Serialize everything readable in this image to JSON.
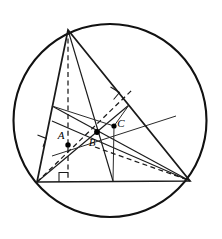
{
  "figure": {
    "background_color": "#ffffff",
    "stroke_color": "#1a1a1a",
    "width": 222,
    "height": 239
  },
  "circle": {
    "name": "circumcircle",
    "cx": 110,
    "cy": 120.5,
    "r": 96.5,
    "stroke": "#111111",
    "stroke_width": 2.1
  },
  "triangle": {
    "name": "main-triangle",
    "vertices": [
      {
        "label": "",
        "x": 68,
        "y": 30
      },
      {
        "label": "",
        "x": 37,
        "y": 182
      },
      {
        "label": "",
        "x": 190,
        "y": 181
      }
    ],
    "path": "M 68 30 L 37 182 L 190 181 Z"
  },
  "points": [
    {
      "id": "A",
      "label": "A",
      "x": 68,
      "y": 145,
      "label_x": 61,
      "label_y": 139,
      "role": "orthocenter"
    },
    {
      "id": "B",
      "label": "B",
      "x": 97,
      "y": 132,
      "label_x": 92,
      "label_y": 146,
      "role": "centroid"
    },
    {
      "id": "C",
      "label": "C",
      "x": 114,
      "y": 126,
      "label_x": 121,
      "label_y": 127,
      "role": "circumcenter"
    }
  ],
  "segments": {
    "altitudes": [
      {
        "name": "altitude-from-apex",
        "from": [
          68,
          30
        ],
        "to": [
          68,
          182
        ],
        "style": "dashed"
      },
      {
        "name": "altitude-from-bottom-left",
        "from": [
          37,
          182
        ],
        "to": [
          132,
          90
        ],
        "style": "dashed"
      },
      {
        "name": "altitude-from-bottom-right",
        "from": [
          190,
          181
        ],
        "to": [
          52,
          121
        ],
        "style": "solid"
      }
    ],
    "medians": [
      {
        "name": "median-from-apex",
        "from": [
          68,
          30
        ],
        "to": [
          113,
          181
        ],
        "style": "solid"
      },
      {
        "name": "median-from-bottom-left",
        "from": [
          37,
          182
        ],
        "to": [
          129,
          105
        ],
        "style": "solid"
      },
      {
        "name": "median-from-bottom-right",
        "from": [
          190,
          181
        ],
        "to": [
          52,
          106
        ],
        "style": "solid"
      }
    ],
    "perpendicular_bisectors": [
      {
        "name": "perp-bisector-left-side",
        "from": [
          52,
          106
        ],
        "to": [
          114,
          126
        ],
        "style": "solid"
      },
      {
        "name": "perp-bisector-base",
        "from": [
          113,
          181
        ],
        "to": [
          114,
          126
        ],
        "style": "solid"
      },
      {
        "name": "perp-bisector-right-side",
        "from": [
          129,
          105
        ],
        "to": [
          114,
          126
        ],
        "style": "solid"
      }
    ],
    "euler_line": {
      "name": "euler-line",
      "from": [
        52,
        156
      ],
      "to": [
        176,
        116
      ],
      "style": "solid"
    },
    "dashed_extras": [
      {
        "name": "dashed-to-bottom-right",
        "from": [
          95,
          147
        ],
        "to": [
          188,
          180
        ],
        "style": "dashed"
      }
    ]
  },
  "right_angle_marks": [
    {
      "name": "right-angle-base-foot",
      "x": 62,
      "y": 172,
      "size": 9,
      "orientation": "base"
    },
    {
      "name": "right-angle-left-side",
      "x": 40,
      "y": 136,
      "size": 9,
      "orientation": "left"
    },
    {
      "name": "right-angle-right-side",
      "x": 113,
      "y": 89,
      "size": 9,
      "orientation": "hypotenuse"
    }
  ],
  "labels": {
    "A": "A",
    "B": "B",
    "C": "C"
  }
}
